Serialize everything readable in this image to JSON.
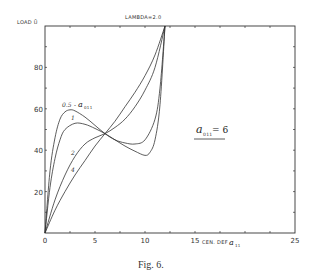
{
  "chart_data": {
    "type": "line",
    "title": "LAMBDA=2.0",
    "xlabel": "CEN. DEF  a11",
    "ylabel": "LOAD Ū",
    "xlim": [
      0,
      25
    ],
    "ylim": [
      0,
      100
    ],
    "x_ticks": [
      0,
      5,
      10,
      15,
      25
    ],
    "x_tick_labels": [
      "0",
      "5",
      "10",
      "15",
      "25"
    ],
    "y_ticks": [
      20,
      40,
      60,
      80
    ],
    "y_tick_labels": [
      "20",
      "40",
      "60",
      "80"
    ],
    "grid": false,
    "legend_position": "inline curve labels",
    "annotation": "a011 = 6",
    "curve_group_label": "a011",
    "series": [
      {
        "name": "0.5",
        "x": [
          0,
          0.5,
          1,
          1.5,
          2,
          2.5,
          3,
          4,
          5,
          6,
          7,
          8,
          9,
          10,
          11,
          11.5,
          12
        ],
        "y": [
          0,
          30,
          46,
          55,
          58.5,
          59.5,
          59,
          56,
          52,
          48,
          45,
          43.5,
          43,
          45,
          55,
          70,
          100
        ]
      },
      {
        "name": "1",
        "x": [
          0,
          0.5,
          1,
          1.5,
          2,
          3,
          4,
          5,
          6,
          7,
          8,
          9,
          10,
          10.5,
          11,
          11.5,
          12
        ],
        "y": [
          0,
          22,
          36,
          45,
          50,
          53,
          52.5,
          50.5,
          48,
          45,
          42,
          39.5,
          37.5,
          39,
          45,
          62,
          100
        ]
      },
      {
        "name": "2",
        "x": [
          0,
          1,
          2,
          3,
          4,
          5,
          6,
          7,
          8,
          9,
          10,
          11,
          12
        ],
        "y": [
          0,
          16,
          28,
          37,
          43,
          46,
          48,
          51,
          55,
          61,
          69,
          80,
          100
        ]
      },
      {
        "name": "4",
        "x": [
          0,
          1,
          2,
          3,
          4,
          5,
          6,
          7,
          8,
          9,
          10,
          11,
          12
        ],
        "y": [
          0,
          11,
          20,
          28,
          35,
          42,
          48,
          54,
          61,
          68,
          76,
          86,
          100
        ]
      }
    ]
  },
  "labels": {
    "title": "LAMBDA=2.0",
    "y_axis": "LOAD Ū",
    "x_axis_text": "CEN. DEF",
    "x_axis_symbol": "a",
    "x_axis_subscript": "11",
    "curve_label_05": "0.5",
    "curve_label_05_symbol": "a",
    "curve_label_05_subscript": "011",
    "curve_label_1": "1",
    "curve_label_2": "2",
    "curve_label_4": "4",
    "annotation_symbol": "a",
    "annotation_subscript": "011",
    "annotation_value": "= 6",
    "caption": "Fig. 6."
  }
}
